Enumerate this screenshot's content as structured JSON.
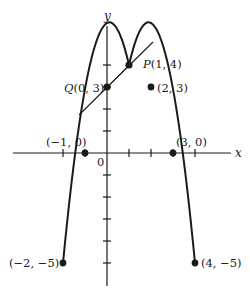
{
  "figure": {
    "type": "function-graph",
    "function": "y = -x^2 + 2x + 3",
    "axes": {
      "x_label": "x",
      "y_label": "y",
      "origin_label": "0",
      "x_ticks": [
        -2,
        -1,
        0,
        1,
        2,
        3,
        4
      ],
      "y_ticks": [
        -6,
        -5,
        -4,
        -3,
        -2,
        -1,
        1,
        2,
        3,
        4
      ]
    },
    "points": [
      {
        "id": "P",
        "x": 1,
        "y": 4,
        "label": "P(1, 4)"
      },
      {
        "id": "Q",
        "x": 0,
        "y": 3,
        "label": "Q(0, 3)"
      },
      {
        "id": "A",
        "x": 2,
        "y": 3,
        "label": "(2, 3)"
      },
      {
        "id": "B",
        "x": -1,
        "y": 0,
        "label": "(−1, 0)"
      },
      {
        "id": "C",
        "x": 3,
        "y": 0,
        "label": "(3, 0)"
      },
      {
        "id": "D",
        "x": -2,
        "y": -5,
        "label": "(−2, −5)"
      },
      {
        "id": "E",
        "x": 4,
        "y": -5,
        "label": "(4, −5)"
      }
    ],
    "lines": [
      {
        "name": "secant-line-QP",
        "through": [
          "Q",
          "P"
        ]
      }
    ],
    "colors": {
      "ink": "#1a1a1a",
      "background": "#ffffff"
    }
  }
}
